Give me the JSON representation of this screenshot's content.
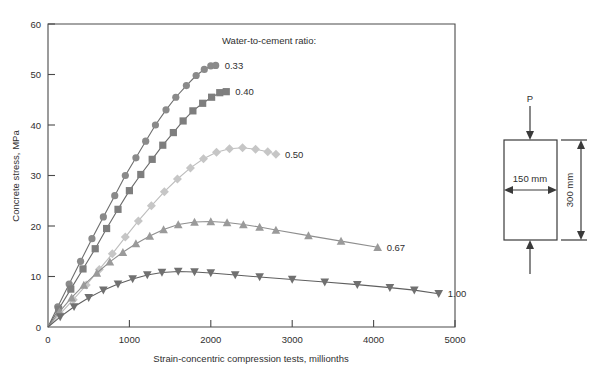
{
  "chart_data": {
    "type": "line",
    "title": "",
    "xlabel": "Strain-concentric compression tests, millionths",
    "ylabel": "Concrete stress, MPa",
    "xlim": [
      0,
      5000
    ],
    "ylim": [
      0,
      60
    ],
    "xticks": [
      0,
      1000,
      2000,
      3000,
      4000,
      5000
    ],
    "yticks": [
      0,
      10,
      20,
      30,
      40,
      50,
      60
    ],
    "xtick_labels": [
      "0",
      "1000",
      "2000",
      "3000",
      "4000",
      "5000"
    ],
    "ytick_labels": [
      "0",
      "10",
      "20",
      "30",
      "40",
      "50",
      "60"
    ],
    "grid": false,
    "legend_title": "Water-to-cement ratio:",
    "legend_position": "inline-right-of-curve-ends",
    "series": [
      {
        "name": "0.33",
        "label": "0.33",
        "marker": "circle",
        "color": "#8a8a8a",
        "line_color": "#6e6e6e",
        "x": [
          0,
          120,
          260,
          400,
          540,
          680,
          820,
          950,
          1080,
          1200,
          1320,
          1450,
          1570,
          1700,
          1820,
          1920,
          2000,
          2060
        ],
        "y": [
          0,
          4.0,
          8.5,
          13.0,
          17.5,
          21.8,
          26.0,
          30.0,
          33.5,
          36.8,
          40.0,
          43.0,
          45.5,
          47.8,
          49.8,
          51.0,
          51.7,
          51.8
        ]
      },
      {
        "name": "0.40",
        "label": "0.40",
        "marker": "square",
        "color": "#7e7e7e",
        "line_color": "#6a6a6a",
        "x": [
          0,
          130,
          280,
          430,
          580,
          720,
          860,
          1000,
          1140,
          1280,
          1410,
          1540,
          1660,
          1780,
          1900,
          2010,
          2110,
          2190
        ],
        "y": [
          0,
          3.5,
          7.5,
          11.5,
          15.5,
          19.5,
          23.3,
          27.0,
          30.2,
          33.2,
          36.0,
          38.5,
          40.8,
          42.8,
          44.3,
          45.5,
          46.4,
          46.6
        ]
      },
      {
        "name": "0.50",
        "label": "0.50",
        "marker": "diamond",
        "color": "#c6c6c6",
        "line_color": "#bdbdbd",
        "x": [
          0,
          150,
          310,
          470,
          630,
          790,
          950,
          1110,
          1270,
          1430,
          1590,
          1750,
          1910,
          2070,
          2230,
          2390,
          2550,
          2700,
          2800
        ],
        "y": [
          0,
          2.6,
          5.4,
          8.3,
          11.4,
          14.5,
          17.8,
          21.0,
          24.0,
          26.8,
          29.3,
          31.5,
          33.3,
          34.6,
          35.3,
          35.5,
          35.2,
          34.7,
          34.2
        ]
      },
      {
        "name": "0.67",
        "label": "0.67",
        "marker": "triangle-up",
        "color": "#9a9a9a",
        "line_color": "#8e8e8e",
        "x": [
          0,
          140,
          290,
          440,
          600,
          760,
          920,
          1080,
          1250,
          1420,
          1600,
          1800,
          2000,
          2200,
          2400,
          2600,
          2800,
          3200,
          3600,
          4050
        ],
        "y": [
          0,
          3.0,
          5.8,
          8.3,
          10.7,
          12.9,
          14.8,
          16.5,
          18.0,
          19.3,
          20.3,
          20.8,
          20.9,
          20.7,
          20.3,
          19.8,
          19.2,
          18.1,
          17.0,
          15.8
        ]
      },
      {
        "name": "1.00",
        "label": "1.00",
        "marker": "triangle-down",
        "color": "#707070",
        "line_color": "#5f5f5f",
        "x": [
          0,
          150,
          320,
          500,
          680,
          860,
          1040,
          1220,
          1400,
          1600,
          1800,
          2000,
          2300,
          2600,
          3000,
          3400,
          3800,
          4200,
          4500,
          4800
        ],
        "y": [
          0,
          2.0,
          4.0,
          5.8,
          7.3,
          8.5,
          9.5,
          10.3,
          10.8,
          11.0,
          10.9,
          10.7,
          10.3,
          9.9,
          9.4,
          8.9,
          8.4,
          7.8,
          7.3,
          6.6
        ]
      }
    ]
  },
  "specimen_diagram": {
    "load_label": "P",
    "width_label": "150 mm",
    "height_label": "300 mm"
  }
}
